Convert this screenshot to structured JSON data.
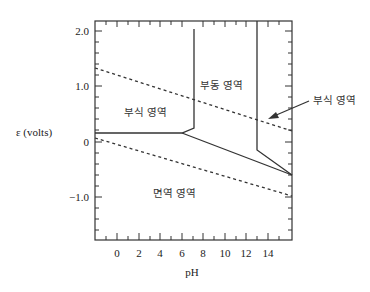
{
  "diagram": {
    "type": "pourbaix",
    "xlabel": "pH",
    "ylabel": "ε (volts)",
    "x_ticks": [
      "0",
      "2",
      "4",
      "6",
      "8",
      "10",
      "12",
      "14"
    ],
    "y_ticks": [
      "2.0",
      "1.0",
      "0",
      "−1.0"
    ],
    "regions": {
      "corrosion_left": "부식 영역",
      "passivation": "부동 영역",
      "immunity": "면역 영역",
      "corrosion_right": "부식 영역"
    },
    "lines": {
      "upper_dashed": {
        "style": "dashed",
        "from": {
          "pH": -2,
          "E": 1.32
        },
        "to": {
          "pH": 16,
          "E": 0.2
        }
      },
      "lower_dashed": {
        "style": "dashed",
        "from": {
          "pH": -2,
          "E": 0.07
        },
        "to": {
          "pH": 16,
          "E": -0.98
        }
      },
      "horizontal_boundary": {
        "style": "solid",
        "E": 0.16,
        "pH_range": [
          -2,
          6.1
        ]
      },
      "first_vertical": {
        "style": "solid",
        "pH": 7.2,
        "E_range": [
          0.26,
          2.05
        ]
      },
      "second_vertical": {
        "style": "solid",
        "pH": 12.9,
        "E_range": [
          -0.15,
          2.2
        ]
      },
      "sloping_boundary": {
        "style": "solid",
        "from": {
          "pH": 6.1,
          "E": 0.16
        },
        "to": {
          "pH": 16,
          "E": -0.59
        }
      }
    }
  }
}
